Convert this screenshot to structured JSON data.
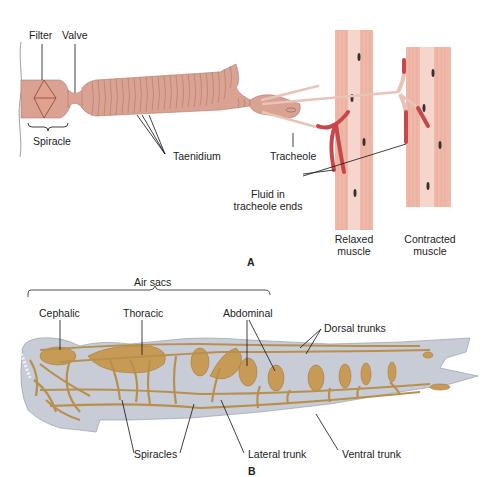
{
  "figure": {
    "panel_a": {
      "letter": "A",
      "labels": {
        "filter": "Filter",
        "valve": "Valve",
        "spiracle": "Spiracle",
        "taenidium": "Taenidium",
        "tracheole": "Tracheole",
        "fluid_line1": "Fluid in",
        "fluid_line2": "tracheole ends",
        "relaxed_line1": "Relaxed",
        "relaxed_line2": "muscle",
        "contracted_line1": "Contracted",
        "contracted_line2": "muscle"
      }
    },
    "panel_b": {
      "letter": "B",
      "labels": {
        "air_sacs": "Air sacs",
        "cephalic": "Cephalic",
        "thoracic": "Thoracic",
        "abdominal": "Abdominal",
        "dorsal_trunks": "Dorsal trunks",
        "spiracles": "Spiracles",
        "lateral_trunk": "Lateral trunk",
        "ventral_trunk": "Ventral trunk"
      }
    },
    "colors": {
      "trachea": "#d9a292",
      "trachea_ring": "#a86e62",
      "fluid": "#c9474a",
      "muscle": "#efb8a8",
      "body": "#c8ccd6",
      "tracheal_system": "#b8904e",
      "air_sac": "#c79a55"
    }
  }
}
